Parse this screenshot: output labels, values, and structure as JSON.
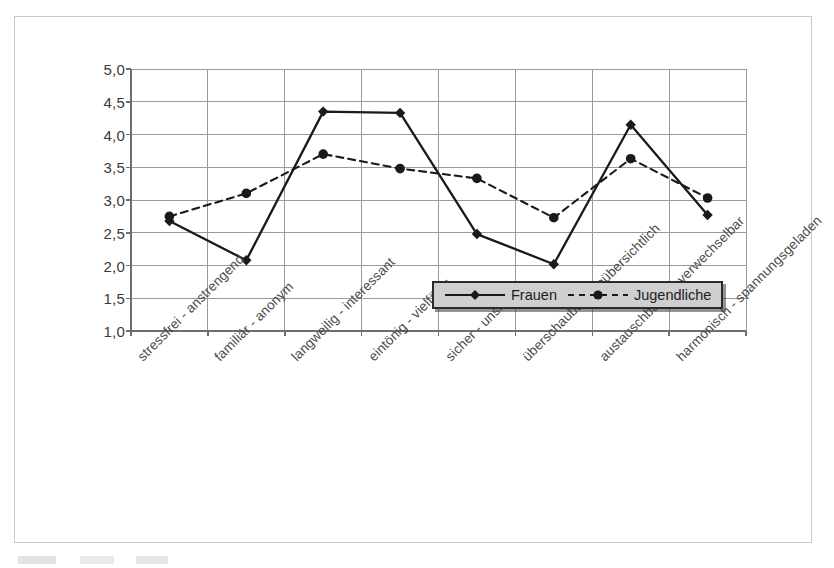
{
  "figure": {
    "frame_border_color": "#c9c9c9",
    "background": "#ffffff"
  },
  "legend": {
    "position": "inside-bottom-right",
    "background": "#cfcfcf",
    "border_color": "#2b2b2b",
    "entries": [
      {
        "label": "Frauen",
        "style": "solid",
        "marker": "diamond",
        "color": "#1a1a1a"
      },
      {
        "label": "Jugendliche",
        "style": "dashed",
        "marker": "circle",
        "color": "#1a1a1a"
      }
    ]
  },
  "chart_data": {
    "type": "line",
    "title": "",
    "subtitle": "",
    "xlabel": "",
    "ylabel": "",
    "ylim": [
      1.0,
      5.0
    ],
    "ytick_step": 0.5,
    "ytick_labels": [
      "5,0",
      "4,5",
      "4,0",
      "3,5",
      "3,0",
      "2,5",
      "2,0",
      "1,5",
      "1,0"
    ],
    "ytick_values": [
      5.0,
      4.5,
      4.0,
      3.5,
      3.0,
      2.5,
      2.0,
      1.5,
      1.0
    ],
    "grid": {
      "horizontal": true,
      "vertical": true,
      "color": "#9a9a9a"
    },
    "decimal_separator": ",",
    "legend_position": "inside bottom right",
    "categories": [
      "stressfrei - anstrengend",
      "familiär - anonym",
      "langweilig - interessant",
      "eintönig - vielfältig",
      "sicher - unsicher",
      "überschaubar - unübersichtlich",
      "austauschbar - unverwechselbar",
      "harmonisch - spannungsgeladen"
    ],
    "series": [
      {
        "name": "Frauen",
        "style": "solid",
        "marker": "diamond",
        "color": "#1a1a1a",
        "values": [
          2.68,
          2.08,
          4.35,
          4.33,
          2.48,
          2.02,
          4.15,
          2.77
        ]
      },
      {
        "name": "Jugendliche",
        "style": "dashed",
        "marker": "circle",
        "color": "#1a1a1a",
        "values": [
          2.75,
          3.1,
          3.7,
          3.48,
          3.33,
          2.73,
          3.63,
          3.03
        ]
      }
    ]
  }
}
